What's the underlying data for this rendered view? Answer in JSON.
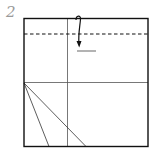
{
  "step": {
    "number": "2"
  },
  "diagram": {
    "type": "origami-fold-step",
    "frame": {
      "x": 24,
      "y": 18.5,
      "width": 124,
      "height": 128,
      "stroke": "#111111"
    },
    "fold_line_dashed": {
      "y": 34,
      "x1": 24,
      "x2": 148,
      "stroke": "#111111",
      "meaning": "valley fold"
    },
    "crease_vertical": {
      "x": 67.5,
      "y1": 18.5,
      "y2": 146.5,
      "stroke": "#555555"
    },
    "crease_horizontal": {
      "y": 82.5,
      "x1": 24,
      "x2": 148,
      "stroke": "#555555"
    },
    "diagonal_creases": [
      {
        "x1": 24,
        "y1": 83,
        "x2": 49,
        "y2": 146.5
      },
      {
        "x1": 24,
        "y1": 83,
        "x2": 86,
        "y2": 146.5
      }
    ],
    "fold_arrow": {
      "from": [
        78,
        18
      ],
      "to": [
        79,
        46
      ],
      "stroke": "#111111"
    },
    "target_mark": {
      "y": 51,
      "x1": 77,
      "x2": 96,
      "stroke": "#8a8a8a"
    }
  }
}
